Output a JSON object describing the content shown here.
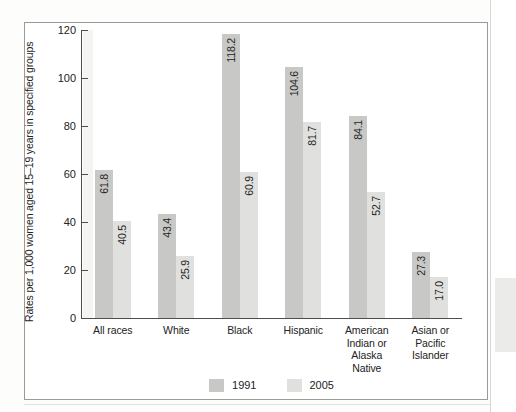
{
  "chart_data": {
    "type": "bar",
    "title": "",
    "xlabel": "",
    "ylabel": "Rates per 1,000 women aged 15–19 years in specified groups",
    "ylim": [
      0,
      120
    ],
    "yticks": [
      "0",
      "20",
      "40",
      "60",
      "80",
      "100",
      "120"
    ],
    "grid": false,
    "legend_position": "bottom-center",
    "categories": [
      "All races",
      "White",
      "Black",
      "Hispanic",
      "American Indian or Alaska Native",
      "Asian or Pacific Islander"
    ],
    "category_lines": [
      [
        "All races"
      ],
      [
        "White"
      ],
      [
        "Black"
      ],
      [
        "Hispanic"
      ],
      [
        "American",
        "Indian or",
        "Alaska",
        "Native"
      ],
      [
        "Asian or",
        "Pacific",
        "Islander"
      ]
    ],
    "series": [
      {
        "name": "1991",
        "color": "#c8c8c6",
        "values": [
          61.8,
          43.4,
          118.2,
          104.6,
          84.1,
          27.3
        ],
        "labels": [
          "61.8",
          "43.4",
          "118.2",
          "104.6",
          "84.1",
          "27.3"
        ]
      },
      {
        "name": "2005",
        "color": "#e0e0de",
        "values": [
          40.5,
          25.9,
          60.9,
          81.7,
          52.7,
          17.0
        ],
        "labels": [
          "40.5",
          "25.9",
          "60.9",
          "81.7",
          "52.7",
          "17.0"
        ]
      }
    ]
  },
  "legend": {
    "items": [
      {
        "label": "1991",
        "color": "#c8c8c6"
      },
      {
        "label": "2005",
        "color": "#e0e0de"
      }
    ]
  }
}
